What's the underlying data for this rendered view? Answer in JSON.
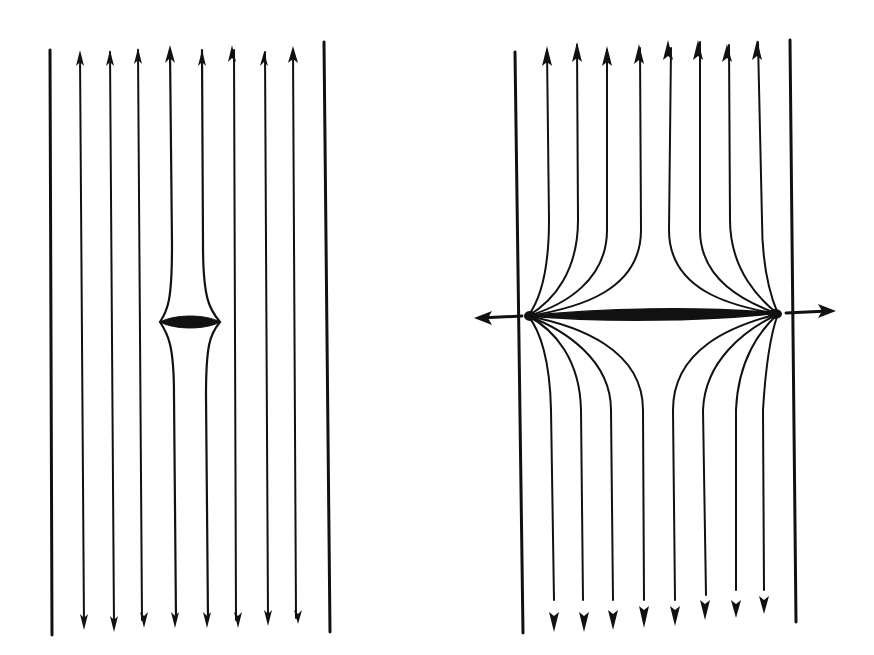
{
  "figure": {
    "ink_color": "#111111",
    "background": "#ffffff",
    "panels": [
      {
        "id": "left",
        "boundary_lines": 2,
        "arrow_lines": 8,
        "arrow_direction_top": "up",
        "arrow_direction_bottom": "down",
        "inclusion": "small lens at center between 4th and 5th arrowed line"
      },
      {
        "id": "right",
        "boundary_lines": 2,
        "arrow_lines": 8,
        "arrow_direction_top": "up",
        "arrow_direction_bottom": "down",
        "inclusion": "long thin lens spanning panel width with side arrows pointing outward"
      }
    ]
  }
}
